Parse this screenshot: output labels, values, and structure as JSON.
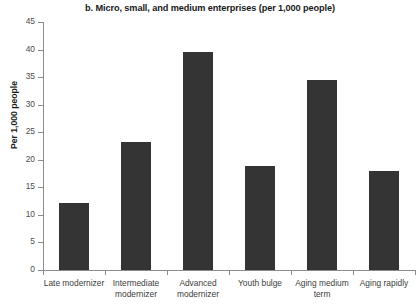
{
  "chart_data": {
    "type": "bar",
    "title": "b. Micro, small, and medium enterprises (per 1,000 people)",
    "xlabel": "",
    "ylabel": "Per 1,000 people",
    "categories": [
      "Late modernizer",
      "Intermediate modernizer",
      "Advanced modernizer",
      "Youth bulge",
      "Aging medium term",
      "Aging rapidly"
    ],
    "values": [
      12.2,
      23.2,
      39.6,
      18.9,
      34.5,
      18.0
    ],
    "ylim": [
      0,
      45
    ],
    "yticks": [
      0,
      5,
      10,
      15,
      20,
      25,
      30,
      35,
      40,
      45
    ],
    "ytick_labels": [
      "0",
      "5",
      "10",
      "15",
      "20",
      "25",
      "30",
      "35",
      "40",
      "45"
    ],
    "grid": false,
    "legend": null,
    "bar_color": "#343434",
    "axis_color": "#8c8c8c",
    "background": "#ffffff"
  }
}
